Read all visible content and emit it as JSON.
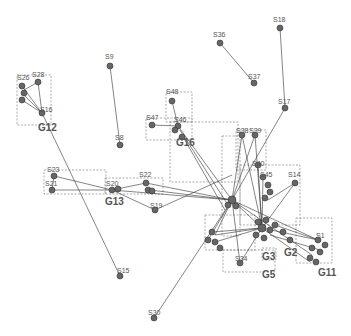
{
  "diagram": {
    "type": "network-graph",
    "colors": {
      "node": "#666666",
      "edge": "#333333",
      "group_box": "#888888",
      "label": "#555555"
    },
    "groups": [
      {
        "id": "G12",
        "label": "G12",
        "box": [
          17,
          75,
          34,
          50
        ],
        "label_pos": [
          38,
          130
        ]
      },
      {
        "id": "G16",
        "label": "G16",
        "box": [
          166,
          96,
          26,
          46
        ],
        "label_pos": [
          176,
          145
        ]
      },
      {
        "id": "G13",
        "label": "G13",
        "box": [
          105,
          180,
          58,
          14
        ],
        "label_pos": [
          105,
          205
        ]
      },
      {
        "id": "G3",
        "label": "G3",
        "box": [
          262,
          250,
          16,
          14
        ],
        "label_pos": [
          262,
          260
        ]
      },
      {
        "id": "G2",
        "label": "G2",
        "box": [
          280,
          245,
          18,
          14
        ],
        "label_pos": [
          284,
          255
        ]
      },
      {
        "id": "G5",
        "label": "G5",
        "box": [
          255,
          262,
          22,
          10
        ],
        "label_pos": [
          262,
          277
        ]
      },
      {
        "id": "G11",
        "label": "G11",
        "box": [
          296,
          218,
          36,
          45
        ],
        "label_pos": [
          318,
          276
        ]
      },
      {
        "id": "G-center",
        "label": "",
        "box": [
          210,
          120,
          30,
          100
        ],
        "label_pos": [
          0,
          0
        ]
      },
      {
        "id": "G-mid",
        "label": "",
        "box": [
          170,
          120,
          70,
          60
        ],
        "label_pos": [
          0,
          0
        ]
      },
      {
        "id": "G-right",
        "label": "",
        "box": [
          220,
          170,
          90,
          60
        ],
        "label_pos": [
          0,
          0
        ]
      },
      {
        "id": "G-left",
        "label": "",
        "box": [
          45,
          170,
          60,
          22
        ],
        "label_pos": [
          0,
          0
        ]
      },
      {
        "id": "G-bottom",
        "label": "",
        "box": [
          205,
          215,
          50,
          35
        ],
        "label_pos": [
          0,
          0
        ]
      }
    ],
    "nodes": [
      {
        "id": "S26",
        "label": "S26",
        "x": 22,
        "y": 86
      },
      {
        "id": "S28",
        "label": "S28",
        "x": 38,
        "y": 82
      },
      {
        "id": "S16",
        "label": "S16",
        "x": 42,
        "y": 113
      },
      {
        "id": "S9",
        "label": "S9",
        "x": 110,
        "y": 66
      },
      {
        "id": "S8",
        "label": "S8",
        "x": 120,
        "y": 145
      },
      {
        "id": "S36",
        "label": "S36",
        "x": 220,
        "y": 43
      },
      {
        "id": "S37",
        "label": "S37",
        "x": 254,
        "y": 83
      },
      {
        "id": "S18",
        "label": "S18",
        "x": 280,
        "y": 28
      },
      {
        "id": "S17",
        "label": "S17",
        "x": 285,
        "y": 108
      },
      {
        "id": "S48",
        "label": "S48",
        "x": 172,
        "y": 101
      },
      {
        "id": "S47",
        "label": "S47",
        "x": 152,
        "y": 125
      },
      {
        "id": "S46",
        "label": "S46",
        "x": 178,
        "y": 126
      },
      {
        "id": "S38",
        "label": "S38",
        "x": 242,
        "y": 135
      },
      {
        "id": "S39",
        "label": "S39",
        "x": 255,
        "y": 135
      },
      {
        "id": "S40",
        "label": "S40",
        "x": 258,
        "y": 165
      },
      {
        "id": "S45",
        "label": "S45",
        "x": 263,
        "y": 177
      },
      {
        "id": "S14",
        "label": "S14",
        "x": 295,
        "y": 183
      },
      {
        "id": "S23",
        "label": "S23",
        "x": 54,
        "y": 176
      },
      {
        "id": "S21",
        "label": "S21",
        "x": 52,
        "y": 190
      },
      {
        "id": "S20",
        "label": "S20",
        "x": 112,
        "y": 190
      },
      {
        "id": "S22",
        "label": "S22",
        "x": 146,
        "y": 183
      },
      {
        "id": "S19",
        "label": "S19",
        "x": 155,
        "y": 210
      },
      {
        "id": "S15",
        "label": "S15",
        "x": 120,
        "y": 276
      },
      {
        "id": "S30",
        "label": "S30",
        "x": 154,
        "y": 318
      },
      {
        "id": "S1",
        "label": "S1",
        "x": 318,
        "y": 240
      },
      {
        "id": "S34",
        "label": "S34",
        "x": 240,
        "y": 263
      },
      {
        "id": "HUB",
        "label": "",
        "x": 232,
        "y": 200
      },
      {
        "id": "HUB2",
        "label": "",
        "x": 262,
        "y": 228
      }
    ]
  }
}
